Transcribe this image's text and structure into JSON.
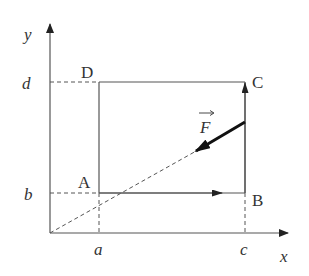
{
  "diagram": {
    "axes": {
      "x_label": "x",
      "y_label": "y"
    },
    "ticks": {
      "x": [
        "a",
        "c"
      ],
      "y": [
        "b",
        "d"
      ]
    },
    "points": {
      "A": "A",
      "B": "B",
      "C": "C",
      "D": "D"
    },
    "force_label": "F",
    "colors": {
      "line": "#555555",
      "force": "#1a1a1a",
      "text": "#333333"
    }
  }
}
